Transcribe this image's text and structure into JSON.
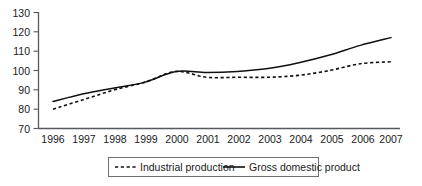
{
  "chart_data": {
    "type": "line",
    "title": "",
    "xlabel": "",
    "ylabel": "",
    "categories": [
      "1996",
      "1997",
      "1998",
      "1999",
      "2000",
      "2001",
      "2002",
      "2003",
      "2004",
      "2005",
      "2006",
      "2007"
    ],
    "x": [
      1996,
      1997,
      1998,
      1999,
      2000,
      2001,
      2002,
      2003,
      2004,
      2005,
      2006,
      2007
    ],
    "series": [
      {
        "name": "Industrial production",
        "style": "dashed",
        "color": "#101010",
        "values": [
          80,
          85,
          90,
          94,
          99.5,
          96.5,
          96.5,
          96.5,
          97.5,
          100,
          103.5,
          104.5
        ]
      },
      {
        "name": "Gross domestic product",
        "style": "solid",
        "color": "#101010",
        "values": [
          84,
          88,
          91,
          94,
          99.5,
          99,
          99.5,
          101,
          104,
          108,
          113,
          117
        ]
      }
    ],
    "ylim": [
      70,
      130
    ],
    "yticks": [
      70,
      80,
      90,
      100,
      110,
      120,
      130
    ],
    "ytick_labels": [
      "70",
      "80",
      "90",
      "100",
      "110",
      "120",
      "130"
    ],
    "xlim": [
      1996,
      2007
    ],
    "grid": false,
    "legend_position": "bottom"
  },
  "legend": {
    "entries": [
      {
        "label": "Industrial production",
        "style": "dashed"
      },
      {
        "label": "Gross domestic product",
        "style": "solid"
      }
    ]
  },
  "axis": {
    "y_axis_name": "value-axis",
    "x_axis_name": "year-axis"
  }
}
